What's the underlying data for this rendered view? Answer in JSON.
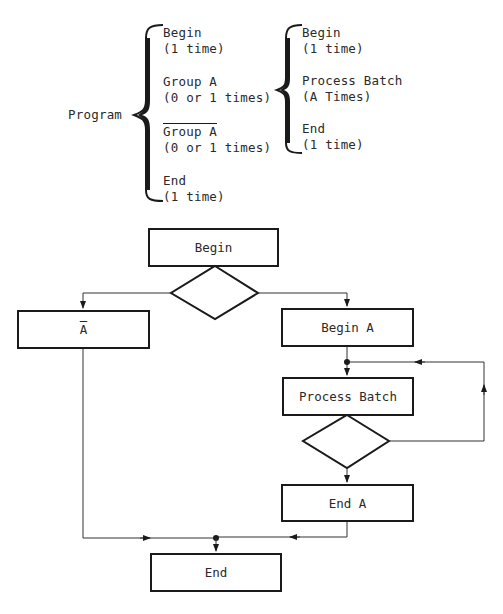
{
  "hierarchy": {
    "root_label": "Program",
    "level1": [
      {
        "title": "Begin",
        "count": "(1 time)"
      },
      {
        "title": "Group A",
        "count": "(0 or 1 times)"
      },
      {
        "title": "Group A",
        "count": "(0 or 1 times)",
        "negated": true
      },
      {
        "title": "End",
        "count": "(1 time)"
      }
    ],
    "level2": [
      {
        "title": "Begin",
        "count": "(1 time)"
      },
      {
        "title": "Process Batch",
        "count": "(A Times)"
      },
      {
        "title": "End",
        "count": "(1 time)"
      }
    ]
  },
  "flowchart": {
    "begin": "Begin",
    "not_a": "A",
    "begin_a": "Begin A",
    "process_batch": "Process Batch",
    "end_a": "End A",
    "end": "End"
  },
  "colors": {
    "line": "#1a1a1a",
    "thin_line": "#333333",
    "background": "#ffffff"
  }
}
